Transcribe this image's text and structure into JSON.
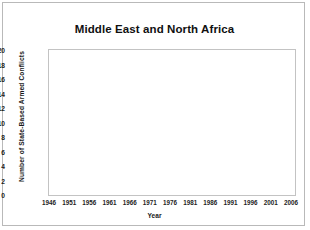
{
  "chart_data": {
    "type": "line",
    "title": "Middle East and North Africa",
    "xlabel": "Year",
    "ylabel": "Number of State-Based Armed Conflicts",
    "xlim": [
      1946,
      2007
    ],
    "ylim": [
      0,
      20
    ],
    "ytick_labels": [
      "0",
      "2",
      "4",
      "6",
      "8",
      "10",
      "12",
      "14",
      "16",
      "18",
      "20"
    ],
    "ytick_values": [
      0,
      2,
      4,
      6,
      8,
      10,
      12,
      14,
      16,
      18,
      20
    ],
    "xtick_labels": [
      "1946",
      "1951",
      "1956",
      "1961",
      "1966",
      "1971",
      "1976",
      "1981",
      "1986",
      "1991",
      "1996",
      "2001",
      "2006"
    ],
    "xtick_values": [
      1946,
      1951,
      1956,
      1961,
      1966,
      1971,
      1976,
      1981,
      1986,
      1991,
      1996,
      2001,
      2006
    ],
    "grid": true,
    "legend": "none",
    "line_color": "#1a1a1a",
    "series": [
      {
        "name": "Number of State-Based Armed Conflicts",
        "x": [
          1946,
          1947,
          1948,
          1949,
          1950,
          1951,
          1952,
          1953,
          1954,
          1955,
          1956,
          1957,
          1958,
          1959,
          1960,
          1961,
          1962,
          1963,
          1964,
          1965,
          1966,
          1967,
          1968,
          1969,
          1970,
          1971,
          1972,
          1973,
          1974,
          1975,
          1976,
          1977,
          1978,
          1979,
          1980,
          1981,
          1982,
          1983,
          1984,
          1985,
          1986,
          1987,
          1988,
          1989,
          1990,
          1991,
          1992,
          1993,
          1994,
          1995,
          1996,
          1997,
          1998,
          1999,
          2000,
          2001,
          2002,
          2003,
          2004,
          2005,
          2006,
          2007
        ],
        "values": [
          2,
          1,
          2,
          1,
          1,
          2,
          1,
          2,
          3,
          2,
          4,
          3,
          4,
          4,
          5,
          4,
          6,
          5,
          6,
          4,
          5,
          3,
          2,
          5,
          4,
          6,
          5,
          5,
          5,
          5,
          5,
          5,
          8,
          5,
          4,
          4,
          11,
          6,
          5,
          7,
          11,
          10,
          9,
          10,
          8,
          9,
          10,
          8,
          11,
          9,
          8,
          7,
          6,
          9,
          10,
          8,
          6,
          5,
          5,
          7,
          6,
          6
        ]
      }
    ]
  }
}
